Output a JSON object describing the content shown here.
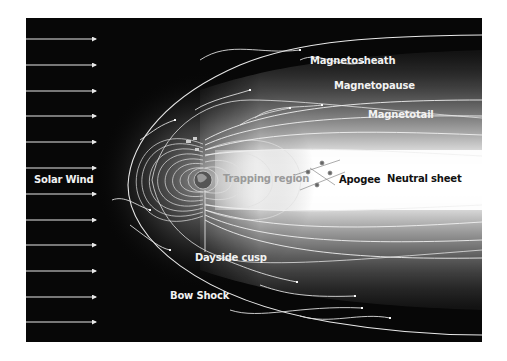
{
  "diagram": {
    "colors": {
      "background": "#ffffff",
      "space": "#070707",
      "field_lines": "#e8e8e8",
      "glow": "#ffffff",
      "label_light": "#f2f2f2",
      "label_dark": "#111111",
      "label_gray": "#9a9a9a"
    },
    "labels": {
      "solar_wind": "Solar Wind",
      "magnetosheath": "Magnetosheath",
      "magnetopause": "Magnetopause",
      "magnetotail": "Magnetotail",
      "trapping_region": "Trapping region",
      "apogee": "Apogee",
      "neutral_sheet": "Neutral sheet",
      "dayside_cusp": "Dayside cusp",
      "bow_shock": "Bow Shock"
    },
    "solar_wind_arrows": {
      "count": 12,
      "y_positions": [
        39,
        65,
        91,
        116,
        142,
        168,
        194,
        220,
        245,
        271,
        297,
        322
      ]
    },
    "objects": {
      "earth": "earth-icon",
      "satellites": "satellite-icon"
    }
  }
}
